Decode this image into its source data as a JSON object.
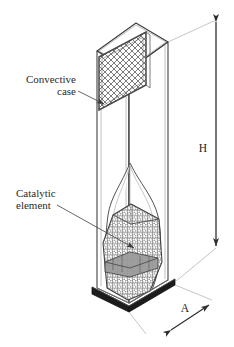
{
  "figure": {
    "background_color": "#ffffff",
    "line_color": "#3a3a3a",
    "dim_color": "#404040",
    "mesh_color": "#6d6d6d",
    "base_color": "#1c1c1c"
  },
  "labels": {
    "convective_case": {
      "line1": "Convective",
      "line2": "case"
    },
    "catalytic_element": {
      "line1": "Catalytic",
      "line2": "element"
    }
  },
  "dimensions": {
    "height": {
      "symbol": "H",
      "orientation": "vertical",
      "description": "overall case height"
    },
    "depth": {
      "symbol": "A",
      "orientation": "diagonal",
      "description": "base plate depth"
    }
  },
  "components": [
    {
      "name": "convective-case",
      "label": "Convective case"
    },
    {
      "name": "mesh-screen-panel",
      "label": ""
    },
    {
      "name": "catalytic-element",
      "label": "Catalytic element"
    },
    {
      "name": "base-plate",
      "label": ""
    }
  ]
}
